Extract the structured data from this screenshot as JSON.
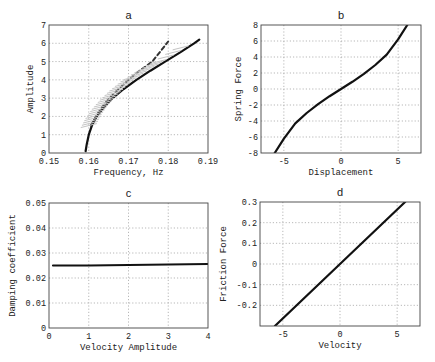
{
  "chart_data": [
    {
      "id": "a",
      "type": "line",
      "title": "a",
      "xlabel": "Frequency, Hz",
      "ylabel": "Amplitude",
      "xlim": [
        0.15,
        0.19
      ],
      "ylim": [
        0,
        7
      ],
      "xticks": [
        "0.15",
        "0.16",
        "0.17",
        "0.18",
        "0.19"
      ],
      "yticks": [
        "0",
        "1",
        "2",
        "3",
        "4",
        "5",
        "6",
        "7"
      ],
      "grid": true,
      "series": [
        {
          "name": "solid",
          "style": "solid",
          "x": [
            0.1592,
            0.1595,
            0.16,
            0.1608,
            0.162,
            0.1638,
            0.166,
            0.1688,
            0.172,
            0.1755,
            0.1792,
            0.183,
            0.1865,
            0.1878
          ],
          "y": [
            0.1,
            0.5,
            1.0,
            1.5,
            2.0,
            2.5,
            3.0,
            3.5,
            4.0,
            4.5,
            5.0,
            5.5,
            6.0,
            6.2
          ]
        },
        {
          "name": "dashed",
          "style": "dashed",
          "x": [
            0.1605,
            0.1618,
            0.1633,
            0.1652,
            0.1675,
            0.17,
            0.1728,
            0.176,
            0.18
          ],
          "y": [
            1.5,
            2.0,
            2.5,
            3.0,
            3.5,
            4.0,
            4.5,
            5.0,
            6.1
          ]
        },
        {
          "name": "hatched band",
          "style": "gray hatch",
          "x": [
            0.16,
            0.1612,
            0.1628,
            0.1648,
            0.1672,
            0.17,
            0.1735,
            0.1775,
            0.185
          ],
          "y": [
            1.5,
            2.0,
            2.5,
            3.0,
            3.5,
            4.0,
            4.5,
            5.0,
            6.0
          ]
        }
      ]
    },
    {
      "id": "b",
      "type": "line",
      "title": "b",
      "xlabel": "Displacement",
      "ylabel": "Spring Force",
      "xlim": [
        -7,
        7
      ],
      "ylim": [
        -8,
        8
      ],
      "xticks": [
        "-5",
        "0",
        "5"
      ],
      "yticks": [
        "-8",
        "-6",
        "-4",
        "-2",
        "0",
        "2",
        "4",
        "6",
        "8"
      ],
      "grid": true,
      "series": [
        {
          "name": "spring force",
          "x": [
            -5.8,
            -5,
            -4,
            -3,
            -2,
            -1,
            0,
            1,
            2,
            3,
            4,
            5,
            5.8
          ],
          "y": [
            -8,
            -6.2,
            -4.3,
            -3.0,
            -1.9,
            -0.9,
            0,
            0.9,
            1.9,
            3.0,
            4.3,
            6.2,
            8
          ]
        }
      ]
    },
    {
      "id": "c",
      "type": "line",
      "title": "c",
      "xlabel": "Velocity Amplitude",
      "ylabel": "Damping coefficient",
      "xlim": [
        0,
        4
      ],
      "ylim": [
        0,
        0.05
      ],
      "xticks": [
        "0",
        "1",
        "2",
        "3",
        "4"
      ],
      "yticks": [
        "0",
        "0.01",
        "0.02",
        "0.03",
        "0.04",
        "0.05"
      ],
      "grid": true,
      "series": [
        {
          "name": "damping coefficient",
          "x": [
            0.1,
            1,
            2,
            3,
            4
          ],
          "y": [
            0.025,
            0.025,
            0.0252,
            0.0254,
            0.0256
          ]
        }
      ]
    },
    {
      "id": "d",
      "type": "line",
      "title": "d",
      "xlabel": "Velocity",
      "ylabel": "Friction Force",
      "xlim": [
        -7,
        7
      ],
      "ylim": [
        -0.3,
        0.3
      ],
      "xticks": [
        "-5",
        "0",
        "5"
      ],
      "yticks": [
        "-0.2",
        "-0.1",
        "0",
        "0.1",
        "0.2",
        "0.3"
      ],
      "grid": true,
      "series": [
        {
          "name": "friction force",
          "x": [
            -5.7,
            0,
            5.7
          ],
          "y": [
            -0.3,
            0,
            0.3
          ]
        }
      ]
    }
  ]
}
